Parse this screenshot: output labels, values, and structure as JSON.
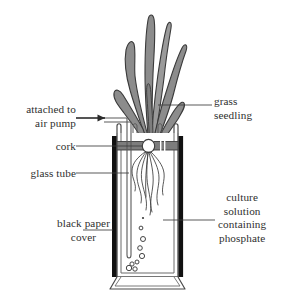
{
  "diagram": {
    "background_color": "#ffffff",
    "ink_color": "#2b2b2b",
    "leaf_fill_color": "#8c8c8c",
    "cork_fill_color": "#7d7d7d",
    "black_cover_color": "#111111"
  },
  "labels": {
    "attached_to_air_pump": {
      "line1": "attached to",
      "line2": "air pump"
    },
    "cork": "cork",
    "glass_tube": "glass tube",
    "black_paper_cover": {
      "line1": "black paper",
      "line2": "cover"
    },
    "grass_seedling": {
      "line1": "grass",
      "line2": "seedling"
    },
    "culture_solution": {
      "line1": "culture",
      "line2": "solution",
      "line3": "containing",
      "line4": "phosphate"
    }
  },
  "parts": {
    "grass_seedling": "grass-seedling",
    "cork": "cork-stopper",
    "glass_tube": "glass-tube",
    "black_paper_cover": "black-paper-cover",
    "culture_solution": "culture-solution",
    "roots": "plant-roots",
    "air_bubbles": "air-bubbles",
    "beaker": "culture-vessel",
    "air_arrow": "air-flow-arrow"
  }
}
